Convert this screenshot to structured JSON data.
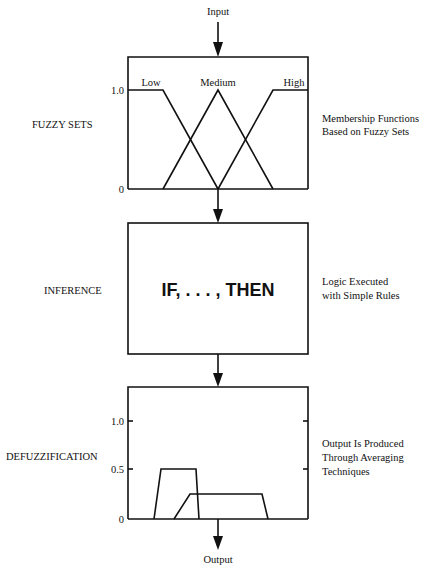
{
  "diagram": {
    "input_label": "Input",
    "output_label": "Output",
    "stages": [
      {
        "name": "FUZZY SETS",
        "description": [
          "Membership Functions",
          "Based on Fuzzy Sets"
        ],
        "y_ticks": [
          "1.0",
          "0"
        ],
        "sets": [
          {
            "label": "Low"
          },
          {
            "label": "Medium"
          },
          {
            "label": "High"
          }
        ]
      },
      {
        "name": "INFERENCE",
        "description": [
          "Logic Executed",
          "with Simple Rules"
        ],
        "rule_text": "IF, . . . , THEN"
      },
      {
        "name": "DEFUZZIFICATION",
        "description": [
          "Output Is Produced",
          "Through Averaging",
          "Techniques"
        ],
        "y_ticks": [
          "1.0",
          "0.5",
          "0"
        ],
        "output_sets": [
          {
            "height": 0.5
          },
          {
            "height": 0.25
          }
        ]
      }
    ]
  }
}
